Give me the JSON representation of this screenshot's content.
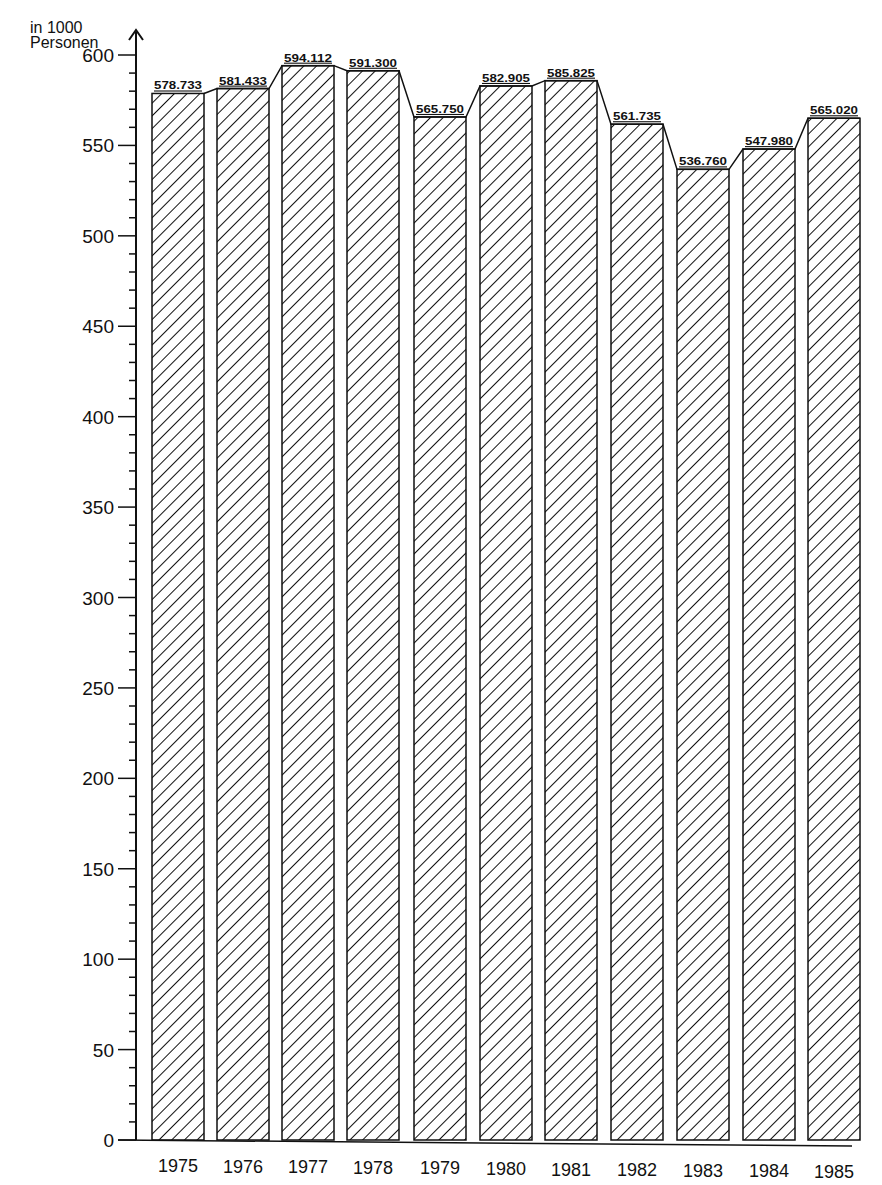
{
  "chart_data": {
    "type": "bar",
    "title": "",
    "xlabel": "",
    "ylabel": "in 1000 Personen",
    "ylabel_lines": [
      "in 1000",
      "Personen"
    ],
    "categories": [
      "1975",
      "1976",
      "1977",
      "1978",
      "1979",
      "1980",
      "1981",
      "1982",
      "1983",
      "1984",
      "1985"
    ],
    "values": [
      578.733,
      581.433,
      594.112,
      591.3,
      565.75,
      582.905,
      585.825,
      561.735,
      536.76,
      547.98,
      565.02
    ],
    "value_labels": [
      "578.733",
      "581.433",
      "594.112",
      "591.300",
      "565.750",
      "582.905",
      "585.825",
      "561.735",
      "536.760",
      "547.980",
      "565.020"
    ],
    "ylim": [
      0,
      600
    ],
    "yticks": [
      0,
      50,
      100,
      150,
      200,
      250,
      300,
      350,
      400,
      450,
      500,
      550,
      600
    ],
    "ytick_labels": [
      "0",
      "50",
      "100",
      "150",
      "200",
      "250",
      "300",
      "350",
      "400",
      "450",
      "500",
      "550",
      "600"
    ],
    "minor_tick_step": 10,
    "grid": false,
    "legend": null,
    "bar_fill": "diagonal-hatch",
    "connecting_line": true,
    "colors": {
      "ink": "#111111",
      "background": "#ffffff"
    }
  }
}
